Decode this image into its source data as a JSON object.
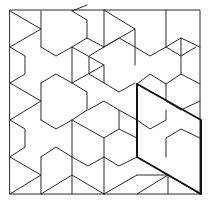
{
  "diagram": {
    "title": "",
    "colors": {
      "line": "#2a2a2a",
      "highlight": "#111111",
      "background": "#ffffff"
    },
    "frame": {
      "x": 10,
      "y": 10,
      "width": 190,
      "height": 184
    },
    "highlight_parallelogram": [
      [
        137,
        84
      ],
      [
        201,
        120
      ],
      [
        201,
        194
      ],
      [
        137,
        157
      ]
    ]
  }
}
